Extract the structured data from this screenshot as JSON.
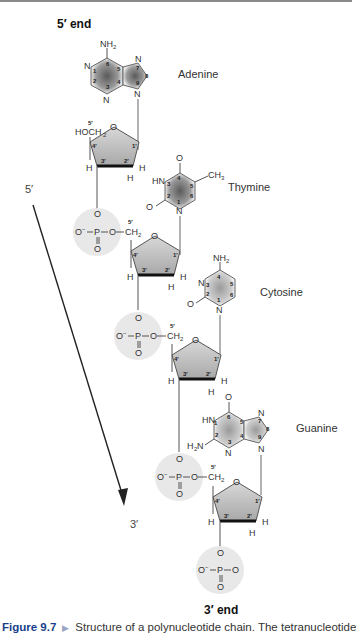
{
  "figure": {
    "top_label": "5′ end",
    "bottom_label": "3′ end",
    "direction": {
      "start": "5′",
      "end": "3′"
    },
    "bases": [
      {
        "name": "Adenine",
        "atoms": [
          "NH2",
          "N",
          "N",
          "N",
          "N"
        ],
        "ring_numbers": [
          "1",
          "2",
          "3",
          "4",
          "5",
          "6",
          "7",
          "8",
          "9"
        ]
      },
      {
        "name": "Thymine",
        "atoms": [
          "O",
          "HN",
          "CH3",
          "O",
          "N"
        ],
        "ring_numbers": [
          "1",
          "2",
          "3",
          "4",
          "5",
          "6"
        ]
      },
      {
        "name": "Cytosine",
        "atoms": [
          "NH2",
          "N",
          "O",
          "N"
        ],
        "ring_numbers": [
          "1",
          "2",
          "3",
          "4",
          "5",
          "6"
        ]
      },
      {
        "name": "Guanine",
        "atoms": [
          "O",
          "HN",
          "H2N",
          "N",
          "N",
          "N"
        ],
        "ring_numbers": [
          "1",
          "2",
          "3",
          "4",
          "5",
          "6",
          "7",
          "8",
          "9"
        ]
      }
    ],
    "sugar": {
      "ring_atom": "O",
      "positions": [
        "1′",
        "2′",
        "3′",
        "4′",
        "5′"
      ],
      "first_5prime_group": "HOCH2",
      "linker": "CH2"
    },
    "phosphate": {
      "atoms": [
        "O",
        "O−",
        "P",
        "O",
        "O"
      ]
    },
    "colors": {
      "sugar_fill": "#b8b8b8",
      "base_shade": "#6a6a6a",
      "phosphate_halo": "#e6e6e6",
      "caption_accent": "#1a3f8a"
    }
  },
  "caption": {
    "figure_number": "Figure 9.7",
    "text": "Structure of a polynucleotide chain. The tetranucleotide"
  }
}
